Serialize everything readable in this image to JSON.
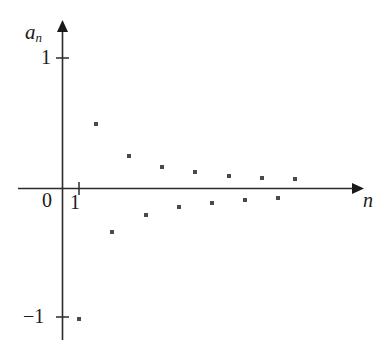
{
  "figure": {
    "background_color": "#ffffff",
    "ink_color": "#1a1a1a",
    "point_color": "#4a4a4a"
  },
  "labels": {
    "y_axis_label": "a",
    "y_axis_label_sub": "n",
    "x_axis_label": "n",
    "y_tick_one": "1",
    "y_tick_neg_one": "−1",
    "origin": "0",
    "x_tick_one": "1"
  },
  "chart_data": {
    "type": "scatter",
    "title": "",
    "xlabel": "n",
    "ylabel": "a_n",
    "grid": false,
    "legend": null,
    "xlim": [
      0,
      14.5
    ],
    "ylim": [
      -1.15,
      1.15
    ],
    "xticks": [
      1
    ],
    "xtick_labels": [
      "1"
    ],
    "yticks": [
      -1,
      0,
      1
    ],
    "ytick_labels": [
      "−1",
      "0",
      "1"
    ],
    "x": [
      1,
      2,
      3,
      4,
      5,
      6,
      7,
      8,
      9,
      10,
      11,
      12,
      13,
      14
    ],
    "values": [
      -1,
      0.5,
      -0.3333,
      0.25,
      -0.2,
      0.1667,
      -0.1429,
      0.125,
      -0.1111,
      0.1,
      -0.0909,
      0.0833,
      -0.0769,
      0.0714
    ],
    "annotations": []
  }
}
